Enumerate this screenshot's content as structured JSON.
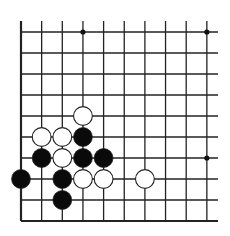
{
  "board": {
    "description": "Go board corner diagram (lower-left corner)",
    "columns": 10,
    "rows": 10,
    "origin_x": 21,
    "origin_y": 32,
    "spacing_x": 20.65,
    "spacing_y": 21,
    "line_color": "#222222",
    "star_points": [
      [
        3,
        0
      ],
      [
        9,
        0
      ],
      [
        9,
        6
      ]
    ],
    "stones": [
      {
        "color": "white",
        "col": 3,
        "row": 4
      },
      {
        "color": "white",
        "col": 1,
        "row": 5
      },
      {
        "color": "white",
        "col": 2,
        "row": 5
      },
      {
        "color": "black",
        "col": 3,
        "row": 5
      },
      {
        "color": "black",
        "col": 1,
        "row": 6
      },
      {
        "color": "white",
        "col": 2,
        "row": 6
      },
      {
        "color": "black",
        "col": 3,
        "row": 6
      },
      {
        "color": "black",
        "col": 4,
        "row": 6
      },
      {
        "color": "black",
        "col": 0,
        "row": 7
      },
      {
        "color": "black",
        "col": 2,
        "row": 7
      },
      {
        "color": "white",
        "col": 3,
        "row": 7
      },
      {
        "color": "white",
        "col": 4,
        "row": 7
      },
      {
        "color": "white",
        "col": 6,
        "row": 7
      },
      {
        "color": "black",
        "col": 2,
        "row": 8
      }
    ]
  }
}
